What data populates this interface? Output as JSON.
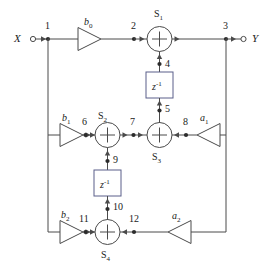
{
  "diagram": {
    "stroke_color": "#4a4a4a",
    "text_color": "#1a1a1a",
    "delay_box_border": "#5a5f8a",
    "signals": {
      "input": "X",
      "output": "Y"
    },
    "gains": [
      {
        "id": "b0",
        "base": "b",
        "sub": "0"
      },
      {
        "id": "b1",
        "base": "b",
        "sub": "1"
      },
      {
        "id": "b2",
        "base": "b",
        "sub": "2"
      },
      {
        "id": "a1",
        "base": "a",
        "sub": "1"
      },
      {
        "id": "a2",
        "base": "a",
        "sub": "2"
      }
    ],
    "summers": [
      {
        "id": "S1",
        "base": "S",
        "sub": "1"
      },
      {
        "id": "S2",
        "base": "S",
        "sub": "2"
      },
      {
        "id": "S3",
        "base": "S",
        "sub": "3"
      },
      {
        "id": "S4",
        "base": "S",
        "sub": "4"
      }
    ],
    "delays": [
      {
        "id": "z1-upper",
        "base": "z",
        "sup": "-1"
      },
      {
        "id": "z1-lower",
        "base": "z",
        "sup": "-1"
      }
    ],
    "nodes": [
      {
        "n": "1"
      },
      {
        "n": "2"
      },
      {
        "n": "3"
      },
      {
        "n": "4"
      },
      {
        "n": "5"
      },
      {
        "n": "6"
      },
      {
        "n": "7"
      },
      {
        "n": "8"
      },
      {
        "n": "9"
      },
      {
        "n": "10"
      },
      {
        "n": "11"
      },
      {
        "n": "12"
      }
    ]
  }
}
